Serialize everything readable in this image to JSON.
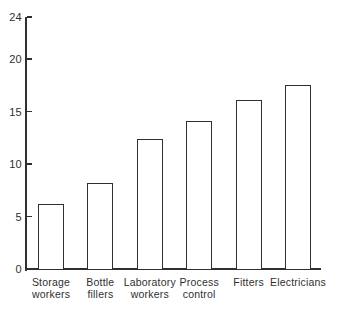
{
  "chart_data": {
    "type": "bar",
    "title": "",
    "xlabel": "",
    "ylabel": "",
    "categories": [
      "Storage workers",
      "Bottle fillers",
      "Laboratory workers",
      "Process control",
      "Fitters",
      "Electricians"
    ],
    "values": [
      6.2,
      8.2,
      12.4,
      14.1,
      16.1,
      17.5
    ],
    "yticks": [
      0,
      5,
      10,
      15,
      20,
      24
    ],
    "ylim": [
      0,
      24
    ],
    "grid": false,
    "legend": false,
    "bar_fill_color": "#ffffff",
    "line_color": "#2f2f2f",
    "background_color": "#ffffff"
  }
}
